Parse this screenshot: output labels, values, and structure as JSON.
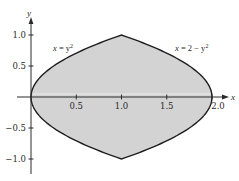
{
  "chart_data": {
    "type": "area",
    "title": "",
    "xlabel": "x",
    "ylabel": "y",
    "xlim": [
      -0.15,
      2.1
    ],
    "ylim": [
      -1.25,
      1.25
    ],
    "grid": false,
    "legend": null,
    "x_ticks": [
      0.5,
      1.0,
      1.5,
      2.0
    ],
    "x_tick_labels": [
      "0.5",
      "1.0",
      "1.5",
      "2.0"
    ],
    "y_ticks": [
      1.0,
      0.5,
      -0.5,
      -1.0
    ],
    "y_tick_labels": [
      "1.0",
      "0.5",
      "−0.5",
      "−1.0"
    ],
    "series": [
      {
        "name": "x = y^2",
        "label": "x = y²",
        "equation": "x = y^2",
        "y_range": [
          -1,
          1
        ]
      },
      {
        "name": "x = 2 - y^2",
        "label": "x = 2 − y²",
        "equation": "x = 2 - y^2",
        "y_range": [
          -1,
          1
        ]
      }
    ],
    "shaded_region": {
      "description": "Region between x = y^2 and x = 2 - y^2",
      "vertices": [
        [
          0,
          0
        ],
        [
          1,
          1
        ],
        [
          2,
          0
        ],
        [
          1,
          -1
        ]
      ],
      "fill": "#d3d3d3"
    },
    "annotations": [
      {
        "text": "x = y²",
        "x": 0.22,
        "y": 0.82
      },
      {
        "text": "x = 2 − y²",
        "x": 1.55,
        "y": 0.82
      }
    ]
  },
  "labels": {
    "x_axis": "x",
    "y_axis": "y",
    "curve_left_lhs": "x",
    "curve_left_rhs": " = y",
    "curve_left_exp": "2",
    "curve_right_lhs": "x",
    "curve_right_rhs": " = 2 − y",
    "curve_right_exp": "2",
    "xt_05": "0.5",
    "xt_10": "1.0",
    "xt_15": "1.5",
    "xt_20": "2.0",
    "yt_10": "1.0",
    "yt_05": "0.5",
    "yt_m05": "−0.5",
    "yt_m10": "−1.0"
  },
  "colors": {
    "fill": "#d3d3d3",
    "stroke": "#1e1e1e",
    "axis": "#2a2a2a",
    "background": "#ffffff"
  }
}
